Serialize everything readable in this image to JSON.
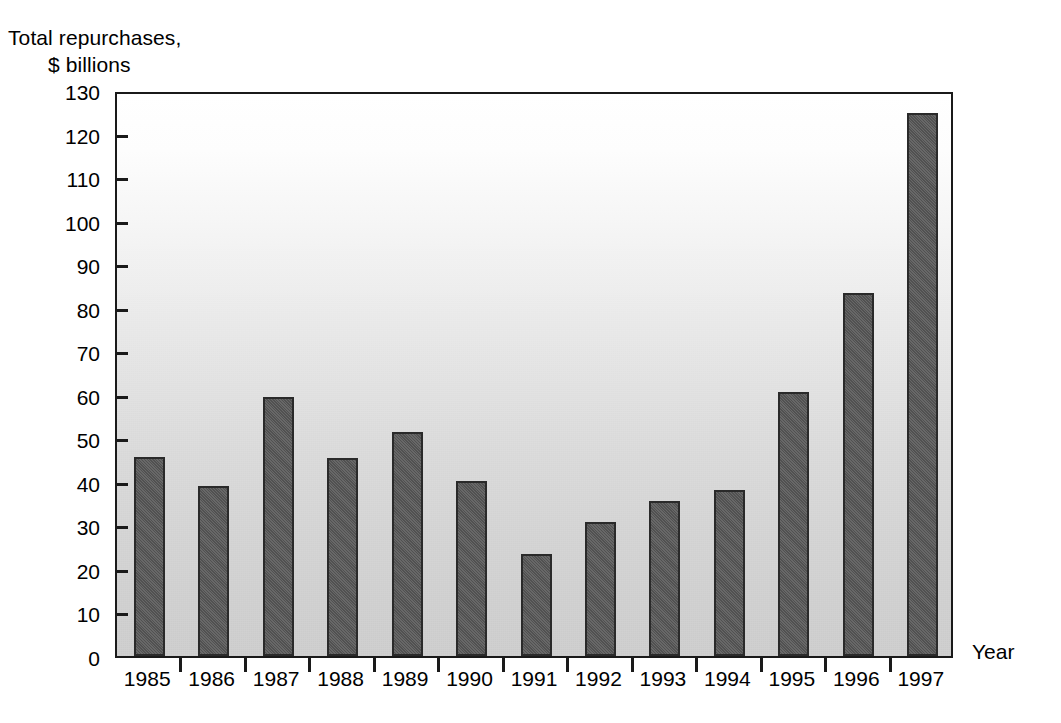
{
  "chart_data": {
    "type": "bar",
    "title": "",
    "ylabel_lines": [
      "Total repurchases,",
      "$ billions"
    ],
    "ylabel": "Total repurchases, $ billions",
    "xlabel": "Year",
    "categories": [
      "1985",
      "1986",
      "1987",
      "1988",
      "1989",
      "1990",
      "1991",
      "1992",
      "1993",
      "1994",
      "1995",
      "1996",
      "1997"
    ],
    "values": [
      45.8,
      39.0,
      59.4,
      45.5,
      51.5,
      40.3,
      23.5,
      30.8,
      35.6,
      38.1,
      60.7,
      83.4,
      124.7
    ],
    "ylim": [
      0,
      130
    ],
    "yticks": [
      0,
      10,
      20,
      30,
      40,
      50,
      60,
      70,
      80,
      90,
      100,
      110,
      120,
      130
    ],
    "ytick_labels": [
      "0",
      "10",
      "20",
      "30",
      "40",
      "50",
      "60",
      "70",
      "80",
      "90",
      "100",
      "110",
      "120",
      "130"
    ],
    "grid": false,
    "legend": null,
    "bar_color": "#575757",
    "bar_edge_color": "#2a2a2a",
    "axis_color": "#1a1a1a",
    "plot_background": "#d0d0d0"
  }
}
